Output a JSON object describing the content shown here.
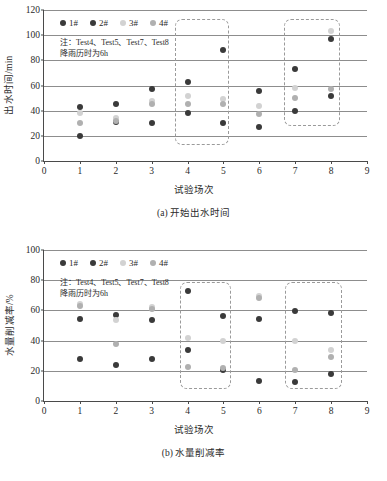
{
  "figure_a": {
    "caption": "(a) 开始出水时间",
    "note": "注：Test4、Test5、Test7、Test8\n降雨历时为6h",
    "legend": [
      {
        "label": "1#",
        "color": "#3a3a3a"
      },
      {
        "label": "2#",
        "color": "#3a3a3a"
      },
      {
        "label": "3#",
        "color": "#d2d2d2"
      },
      {
        "label": "4#",
        "color": "#b0b0b0"
      }
    ],
    "chart_data": {
      "type": "scatter",
      "title": "(a) 开始出水时间",
      "xlabel": "试验场次",
      "ylabel": "出水时间/min",
      "xlim": [
        0,
        9
      ],
      "ylim": [
        0,
        120
      ],
      "xticks": [
        "0",
        "1",
        "2",
        "3",
        "4",
        "5",
        "6",
        "7",
        "8",
        "9"
      ],
      "yticks": [
        "0",
        "20",
        "40",
        "60",
        "80",
        "100",
        "120"
      ],
      "grid": "horizontal",
      "legend_position": "top-left-inside",
      "series": [
        {
          "name": "1#",
          "color": "#3a3a3a",
          "x": [
            1,
            2,
            3,
            4,
            5,
            6,
            7,
            8
          ],
          "values": [
            43,
            45,
            57,
            63,
            88,
            56,
            73,
            97
          ]
        },
        {
          "name": "2#",
          "color": "#3a3a3a",
          "x": [
            1,
            2,
            3,
            4,
            5,
            6,
            7,
            8
          ],
          "values": [
            20,
            31,
            30,
            38,
            30,
            27,
            40,
            52
          ]
        },
        {
          "name": "3#",
          "color": "#d2d2d2",
          "x": [
            1,
            2,
            3,
            4,
            5,
            6,
            7,
            8
          ],
          "values": [
            38,
            34,
            48,
            52,
            49,
            44,
            58,
            103
          ]
        },
        {
          "name": "4#",
          "color": "#b0b0b0",
          "x": [
            1,
            2,
            3,
            4,
            5,
            6,
            7,
            8
          ],
          "values": [
            30,
            32,
            45,
            45,
            45,
            37,
            50,
            57
          ]
        }
      ],
      "highlight_boxes": [
        {
          "x_start": 3.65,
          "x_end": 5.15,
          "y_start": 13,
          "y_end": 113
        },
        {
          "x_start": 6.7,
          "x_end": 8.25,
          "y_start": 28,
          "y_end": 113
        }
      ]
    }
  },
  "figure_b": {
    "caption": "(b) 水量削减率",
    "note": "注：Test4、Test5、Test7、Test8\n降雨历时为6h",
    "legend": [
      {
        "label": "1#",
        "color": "#3a3a3a"
      },
      {
        "label": "2#",
        "color": "#3a3a3a"
      },
      {
        "label": "3#",
        "color": "#d2d2d2"
      },
      {
        "label": "4#",
        "color": "#b0b0b0"
      }
    ],
    "chart_data": {
      "type": "scatter",
      "title": "(b) 水量削减率",
      "xlabel": "试验场次",
      "ylabel": "水量削减率/%",
      "xlim": [
        0,
        9
      ],
      "ylim": [
        0,
        100
      ],
      "xticks": [
        "0",
        "1",
        "2",
        "3",
        "4",
        "5",
        "6",
        "7",
        "8",
        "9"
      ],
      "yticks": [
        "0",
        "20",
        "40",
        "60",
        "80",
        "100"
      ],
      "grid": "horizontal",
      "legend_position": "top-left-inside",
      "series": [
        {
          "name": "1#",
          "color": "#3a3a3a",
          "x": [
            1,
            2,
            3,
            4,
            5,
            6,
            7,
            8
          ],
          "values": [
            54,
            57,
            53.5,
            73,
            56,
            54,
            59.5,
            58
          ]
        },
        {
          "name": "2#",
          "color": "#3a3a3a",
          "x": [
            1,
            2,
            3,
            4,
            5,
            6,
            7,
            8
          ],
          "values": [
            28,
            24,
            28,
            34,
            20.5,
            13,
            12.5,
            18
          ]
        },
        {
          "name": "3#",
          "color": "#d2d2d2",
          "x": [
            1,
            2,
            3,
            4,
            5,
            6,
            7,
            8
          ],
          "values": [
            64,
            53.5,
            62.5,
            42,
            40,
            69.5,
            40,
            34
          ]
        },
        {
          "name": "4#",
          "color": "#b0b0b0",
          "x": [
            1,
            2,
            3,
            4,
            5,
            6,
            7,
            8
          ],
          "values": [
            63,
            38,
            61,
            22.5,
            22,
            68.5,
            20.5,
            29
          ]
        }
      ],
      "highlight_boxes": [
        {
          "x_start": 3.8,
          "x_end": 5.2,
          "y_start": 8,
          "y_end": 79
        },
        {
          "x_start": 6.72,
          "x_end": 8.3,
          "y_start": 8,
          "y_end": 79
        }
      ]
    }
  }
}
